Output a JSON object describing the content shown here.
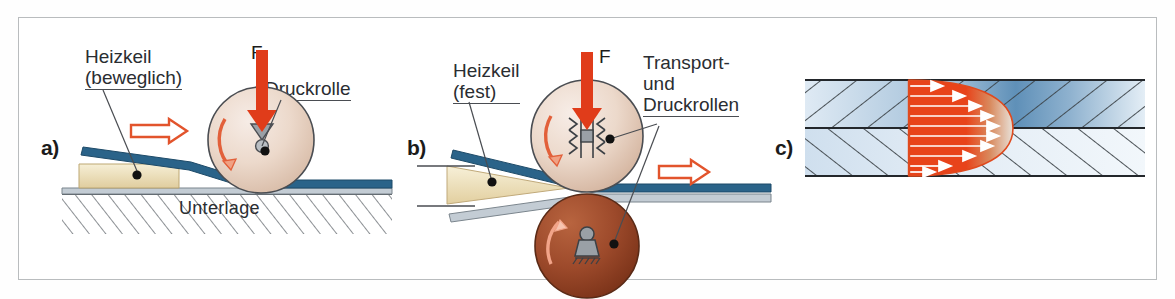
{
  "figure": {
    "background": "#ffffff",
    "border_color": "#b9bcbe"
  },
  "colors": {
    "force_arrow": "#e03c1a",
    "motion_arrow_outline": "#e2542c",
    "rotation_arrow": "#e2603a",
    "sheet_blue": "#2a6389",
    "sheet_gray": "#b9c4cc",
    "wedge_cream": "#efe3bd",
    "roller_light": "#e8d3c6",
    "roller_brown": "#9e4a2c",
    "melt_red": "#e8431a",
    "hatch_blue_dark": "#5f90b8",
    "hatch_blue_light": "#dce8f2",
    "label_text": "#2a2d31",
    "leader_line": "#4a4d52"
  },
  "panels": [
    {
      "id": "a",
      "letter": "a)",
      "caption_hint": "Heizkeil beweglich, Druckrolle auf Unterlage",
      "labels": [
        {
          "name": "heizkeil",
          "lines": [
            "Heizkeil",
            "(beweglich)"
          ]
        },
        {
          "name": "druckrolle",
          "lines": [
            "Druckrolle"
          ]
        },
        {
          "name": "unterlage",
          "lines": [
            "Unterlage"
          ]
        }
      ],
      "force_label": "F",
      "motion_direction": "left",
      "rotation": "clockwise",
      "roller_count": 1,
      "roller_bearing_symbol": "loose-bearing"
    },
    {
      "id": "b",
      "letter": "b)",
      "caption_hint": "Heizkeil fest, Transport- und Druckrollen",
      "labels": [
        {
          "name": "heizkeil",
          "lines": [
            "Heizkeil",
            "(fest)"
          ]
        },
        {
          "name": "rollen",
          "lines": [
            "Transport-",
            "und",
            "Druckrollen"
          ]
        }
      ],
      "force_label": "F",
      "motion_direction": "right",
      "rotation": "clockwise",
      "roller_count": 2,
      "roller_bearing_symbol_top": "floating-bearing",
      "roller_bearing_symbol_bottom": "fixed-bearing"
    },
    {
      "id": "c",
      "letter": "c)",
      "caption_hint": "Schmelzefront mit Geschwindigkeitsprofil im Fuegespalt",
      "labels": [],
      "melt_zone": "red",
      "flow_arrows": 13,
      "layers": 2
    }
  ]
}
